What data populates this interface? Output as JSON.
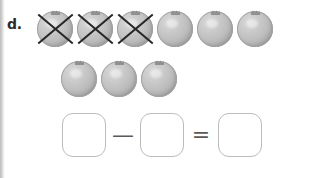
{
  "worksheet": {
    "problem_label": "d.",
    "background_color": "#ffffff"
  },
  "objects": {
    "icon_name": "ball-fruit-icon",
    "cross_icon_name": "cross-out-x-icon",
    "fill_color": "#c0c0c0",
    "outline_color": "#a2a2a2",
    "cross_color": "#262626",
    "total_count": 9,
    "crossed_count": 3,
    "remaining_count": 6,
    "rows": [
      {
        "row_label": "object-row-1",
        "items": [
          {
            "crossed": true
          },
          {
            "crossed": true
          },
          {
            "crossed": true
          },
          {
            "crossed": false
          },
          {
            "crossed": false
          },
          {
            "crossed": false
          }
        ]
      },
      {
        "row_label": "object-row-2",
        "items": [
          {
            "crossed": false
          },
          {
            "crossed": false
          },
          {
            "crossed": false
          }
        ]
      }
    ]
  },
  "equation": {
    "minuend_value": "",
    "minuend_placeholder": "",
    "operator_minus": "—",
    "subtrahend_value": "",
    "subtrahend_placeholder": "",
    "operator_equals": "=",
    "difference_value": "",
    "difference_placeholder": "",
    "box_border_color": "#bcbcbc",
    "operator_color": "#5a5a5a"
  }
}
